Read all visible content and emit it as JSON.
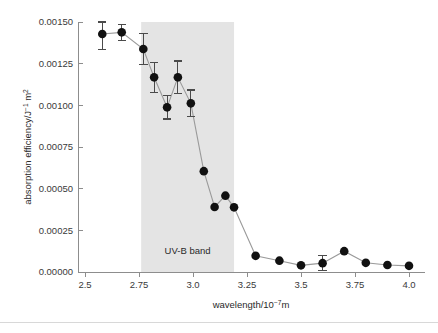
{
  "chart_data": {
    "type": "scatter",
    "title": "",
    "xlabel": "wavelength/10−7m",
    "ylabel": "absorption efficiency/J−1 m2",
    "xlabel_parts": {
      "base": "wavelength/10",
      "exp": "−7",
      "tail": "m"
    },
    "ylabel_parts": {
      "base": "absorption efficiency/J",
      "exp": "−1",
      "tail": " m",
      "exp2": "2"
    },
    "xlim": [
      2.5,
      4.0
    ],
    "ylim": [
      0.0,
      0.0015
    ],
    "xticks": [
      2.5,
      2.75,
      3.0,
      3.25,
      3.5,
      3.75,
      4.0
    ],
    "xtick_labels": [
      "2.5",
      "2.75",
      "3.0",
      "3.25",
      "3.5",
      "3.75",
      "4.0"
    ],
    "yticks": [
      0.0,
      0.00025,
      0.0005,
      0.00075,
      0.001,
      0.00125,
      0.0015
    ],
    "ytick_labels": [
      "0.00000",
      "0.00025",
      "0.00050",
      "0.00075",
      "0.00100",
      "0.00125",
      "0.00150"
    ],
    "grid": false,
    "legend": "none",
    "marker_color": "#111111",
    "line_color": "#9a9a9a",
    "band_color": "#e4e4e4",
    "annotations": [
      {
        "text": "UV-B band",
        "x": 2.975,
        "y": 0.00011
      }
    ],
    "shaded_region": {
      "label": "UV-B band",
      "x_start": 2.76,
      "x_end": 3.19,
      "color": "#e4e4e4"
    },
    "x": [
      2.58,
      2.67,
      2.77,
      2.82,
      2.88,
      2.93,
      2.99,
      3.05,
      3.1,
      3.15,
      3.19,
      3.29,
      3.4,
      3.5,
      3.6,
      3.7,
      3.8,
      3.9,
      4.0
    ],
    "values": [
      0.001428,
      0.001438,
      0.001338,
      0.001168,
      0.000988,
      0.001168,
      0.001012,
      0.000605,
      0.00039,
      0.000458,
      0.000388,
      9.7e-05,
      6.8e-05,
      4e-05,
      5.3e-05,
      0.000125,
      5.5e-05,
      4.2e-05,
      3.7e-05
    ],
    "yerr": [
      9.2e-05,
      4.8e-05,
      9.3e-05,
      9e-05,
      7e-05,
      9.8e-05,
      8e-05,
      0.0,
      0.0,
      0.0,
      0.0,
      0.0,
      0.0,
      0.0,
      4.5e-05,
      0.0,
      0.0,
      0.0,
      0.0
    ],
    "points": [
      {
        "x": 2.58,
        "y": 0.001428,
        "yerr": 9.2e-05
      },
      {
        "x": 2.67,
        "y": 0.001438,
        "yerr": 4.8e-05
      },
      {
        "x": 2.77,
        "y": 0.001338,
        "yerr": 9.3e-05
      },
      {
        "x": 2.82,
        "y": 0.001168,
        "yerr": 9e-05
      },
      {
        "x": 2.88,
        "y": 0.000988,
        "yerr": 7e-05
      },
      {
        "x": 2.93,
        "y": 0.001168,
        "yerr": 9.8e-05
      },
      {
        "x": 2.99,
        "y": 0.001012,
        "yerr": 8e-05
      },
      {
        "x": 3.05,
        "y": 0.000605,
        "yerr": 0.0
      },
      {
        "x": 3.1,
        "y": 0.00039,
        "yerr": 0.0
      },
      {
        "x": 3.15,
        "y": 0.000458,
        "yerr": 0.0
      },
      {
        "x": 3.19,
        "y": 0.000388,
        "yerr": 0.0
      },
      {
        "x": 3.29,
        "y": 9.7e-05,
        "yerr": 0.0
      },
      {
        "x": 3.4,
        "y": 6.8e-05,
        "yerr": 0.0
      },
      {
        "x": 3.5,
        "y": 4e-05,
        "yerr": 0.0
      },
      {
        "x": 3.6,
        "y": 5.3e-05,
        "yerr": 4.5e-05
      },
      {
        "x": 3.7,
        "y": 0.000125,
        "yerr": 0.0
      },
      {
        "x": 3.8,
        "y": 5.5e-05,
        "yerr": 0.0
      },
      {
        "x": 3.9,
        "y": 4.2e-05,
        "yerr": 0.0
      },
      {
        "x": 4.0,
        "y": 3.7e-05,
        "yerr": 0.0
      }
    ]
  }
}
